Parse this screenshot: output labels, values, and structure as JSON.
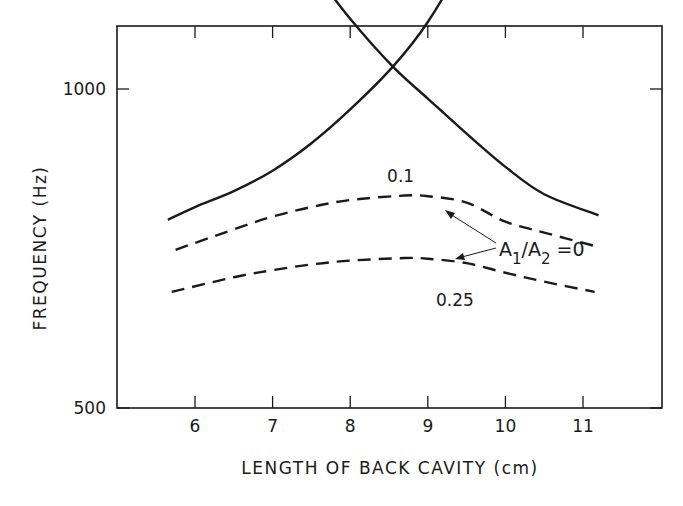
{
  "chart_data": {
    "type": "line",
    "title": "",
    "xlabel": "LENGTH OF BACK CAVITY (cm)",
    "ylabel": "FREQUENCY (Hz)",
    "xlim": [
      5.0,
      12.0
    ],
    "ylim": [
      500,
      1700
    ],
    "xticks": [
      6,
      7,
      8,
      9,
      10,
      11
    ],
    "xtick_labels": [
      "6",
      "7",
      "8",
      "9",
      "10",
      "11"
    ],
    "yticks": [
      500,
      1000,
      1500
    ],
    "ytick_labels": [
      "500",
      "1000",
      "1500"
    ],
    "grid": false,
    "legend": "none (curves labeled inline)",
    "series": [
      {
        "name": "A1/A2 = 0 (upper branch, falling)",
        "style": "solid",
        "x": [
          5.87,
          6.5,
          7.0,
          7.5,
          8.0,
          8.55,
          9.0,
          9.5,
          10.0,
          10.5,
          11.2
        ],
        "y": [
          1505,
          1380,
          1275,
          1190,
          1110,
          1035,
          985,
          930,
          878,
          835,
          802
        ]
      },
      {
        "name": "A1/A2 = 0 (lower branch, rising)",
        "style": "solid",
        "x": [
          5.65,
          6.0,
          6.5,
          7.0,
          7.5,
          8.0,
          8.55,
          9.0,
          9.5,
          10.0,
          10.5,
          11.1
        ],
        "y": [
          795,
          815,
          840,
          872,
          915,
          968,
          1035,
          1105,
          1210,
          1340,
          1420,
          1490
        ]
      },
      {
        "name": "A1/A2 = 0.25 (upper)",
        "style": "dashed",
        "x": [
          5.85,
          6.5,
          7.0,
          7.5,
          8.0,
          8.5,
          9.0,
          9.5,
          10.0,
          10.5,
          10.95
        ],
        "y": [
          1535,
          1445,
          1400,
          1370,
          1352,
          1345,
          1352,
          1385,
          1440,
          1480,
          1516
        ]
      },
      {
        "name": "A1/A2 = 0.1 (upper)",
        "style": "dashed",
        "x": [
          5.85,
          6.5,
          7.0,
          7.5,
          8.0,
          8.5,
          9.0,
          9.5,
          10.0,
          10.5,
          11.0
        ],
        "y": [
          1535,
          1410,
          1340,
          1295,
          1270,
          1260,
          1270,
          1320,
          1410,
          1460,
          1502
        ]
      },
      {
        "name": "A1/A2 = 0.1 (lower)",
        "style": "dashed",
        "x": [
          5.75,
          6.5,
          7.0,
          7.5,
          8.0,
          8.7,
          9.0,
          9.5,
          10.0,
          10.5,
          11.15
        ],
        "y": [
          748,
          780,
          800,
          815,
          826,
          833,
          832,
          822,
          792,
          775,
          754
        ]
      },
      {
        "name": "A1/A2 = 0.25 (lower)",
        "style": "dashed",
        "x": [
          5.7,
          6.5,
          7.0,
          7.5,
          8.0,
          8.7,
          9.0,
          9.5,
          10.0,
          10.5,
          11.15
        ],
        "y": [
          682,
          705,
          716,
          725,
          731,
          735,
          734,
          727,
          712,
          698,
          682
        ]
      }
    ],
    "annotations": [
      {
        "text": "0.25",
        "x": 9.65,
        "y": 1495
      },
      {
        "text": "0.1",
        "x": 8.85,
        "y": 1195
      },
      {
        "text": "0.1",
        "x": 8.65,
        "y": 855
      },
      {
        "text": "0.25",
        "x": 9.35,
        "y": 660
      },
      {
        "text": "A1/A2 = 0",
        "x": 10.3,
        "y": 1000,
        "arrows_to": [
          [
            9.25,
            1095
          ],
          [
            9.4,
            965
          ]
        ]
      }
    ]
  },
  "labels": {
    "xlabel": "LENGTH OF BACK CAVITY (cm)",
    "ylabel": "FREQUENCY (Hz)",
    "ann_A": "A",
    "ann_sub1": "1",
    "ann_slash": "/A",
    "ann_sub2": "2",
    "ann_eq": "=0"
  }
}
